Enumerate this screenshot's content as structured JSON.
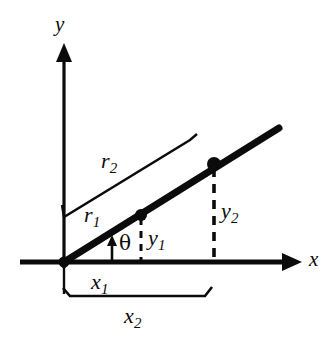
{
  "figure": {
    "type": "geometry-diagram",
    "background_color": "#ffffff",
    "ink_color": "#0b0b0b",
    "axes": {
      "x_label": "x",
      "y_label": "y",
      "origin": {
        "x": 64,
        "y": 262
      },
      "x_axis": {
        "from_x": 20,
        "to_x": 300,
        "y": 262,
        "arrow": "right",
        "thickness": 5
      },
      "y_axis": {
        "x": 64,
        "from_y": 262,
        "to_y": 45,
        "arrow": "up",
        "thickness": 3
      }
    },
    "ray": {
      "label": "ray",
      "from": {
        "x": 64,
        "y": 262
      },
      "to": {
        "x": 278,
        "y": 128
      },
      "thickness": 7
    },
    "angle": {
      "label": "θ",
      "symbol_name": "theta",
      "vertex": {
        "x": 64,
        "y": 262
      },
      "indicator_x": 112,
      "indicator_from_y": 262,
      "indicator_to_y": 238,
      "label_pos": {
        "x": 118,
        "y": 234
      }
    },
    "points": [
      {
        "name": "point-1",
        "x": 141,
        "y": 215,
        "radius": 6,
        "drop_label": "y",
        "drop_sub": "1",
        "drop_label_pos": {
          "x": 150,
          "y": 227
        }
      },
      {
        "name": "point-2",
        "x": 214,
        "y": 164,
        "radius": 7,
        "drop_label": "y",
        "drop_sub": "2",
        "drop_label_pos": {
          "x": 223,
          "y": 202
        }
      }
    ],
    "radial_measures": [
      {
        "name": "r1",
        "label": "r",
        "sub": "1",
        "label_pos": {
          "x": 86,
          "y": 206
        },
        "line": {
          "x1": 64,
          "y1": 250,
          "x2": 137,
          "y2": 205
        },
        "has_brace": false
      },
      {
        "name": "r2",
        "label": "r",
        "sub": "2",
        "label_pos": {
          "x": 103,
          "y": 152
        },
        "line": {
          "x1": 66,
          "y1": 216,
          "x2": 190,
          "y2": 140
        },
        "start_hook": {
          "x": 63,
          "y": 207
        },
        "end_hook": {
          "x": 196,
          "y": 134
        },
        "has_brace": true
      }
    ],
    "horizontal_measures": [
      {
        "name": "x1",
        "label": "x",
        "sub": "1",
        "label_pos": {
          "x": 92,
          "y": 272
        },
        "line": {
          "x1": 64,
          "y1": 268,
          "x2": 141,
          "y2": 268
        },
        "visible_line": false
      },
      {
        "name": "x2",
        "label": "x",
        "sub": "2",
        "label_pos": {
          "x": 124,
          "y": 306
        },
        "line": {
          "x1": 64,
          "y1": 296,
          "x2": 205,
          "y2": 296
        },
        "left_hook_y": 305,
        "right_hook": {
          "x": 212,
          "y": 287
        },
        "visible_line": true
      }
    ],
    "dashed_drops": [
      {
        "name": "drop-1",
        "x": 141,
        "from_y": 215,
        "to_y": 262,
        "dash": "7,6",
        "width": 3
      },
      {
        "name": "drop-2",
        "x": 214,
        "from_y": 164,
        "to_y": 262,
        "dash": "8,7",
        "width": 3.5
      }
    ],
    "origin_marker": {
      "x": 64,
      "y": 262,
      "radius": 5
    }
  }
}
